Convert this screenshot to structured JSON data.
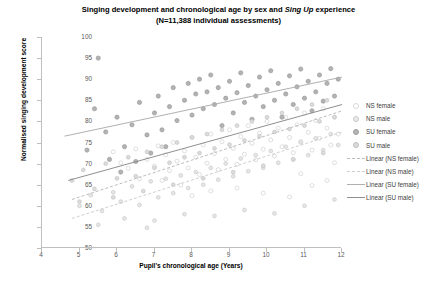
{
  "title": {
    "line1_a": "Singing development and chronological age by sex and ",
    "line1_italic": "Sing Up",
    "line1_b": " experience",
    "line2": "(N=11,388 individual assessments)"
  },
  "axes": {
    "xlabel": "Pupil's chronological age (Years)",
    "ylabel": "Normalised singing development score",
    "xticks": [
      "4",
      "5",
      "6",
      "7",
      "8",
      "9",
      "10",
      "11",
      "12"
    ],
    "yticks": [
      "100",
      "95",
      "90",
      "85",
      "80",
      "75",
      "70",
      "65",
      "60",
      "55",
      "50"
    ]
  },
  "legend": {
    "items": [
      {
        "label": "NS female",
        "key": "marker",
        "style": "nsf"
      },
      {
        "label": "NS male",
        "key": "marker",
        "style": "nsm"
      },
      {
        "label": "SU female",
        "key": "marker",
        "style": "suf"
      },
      {
        "label": "SU male",
        "key": "marker",
        "style": "sum"
      },
      {
        "label": "Linear (NS female)",
        "key": "line",
        "style": "nsf"
      },
      {
        "label": "Linear (NS male)",
        "key": "line",
        "style": "nsm"
      },
      {
        "label": "Linear (SU female)",
        "key": "line",
        "style": "suf"
      },
      {
        "label": "Linear (SU male)",
        "key": "line",
        "style": "sum"
      }
    ]
  },
  "colors": {
    "ns_female": "#d9d9d9",
    "ns_male": "#c9c9c9",
    "su_female": "#a6a6a6",
    "su_male": "#d0d0d0",
    "axis": "#bfbfbf",
    "tick_text": "#595959"
  },
  "chart_data": {
    "type": "scatter",
    "title": "Singing development and chronological age by sex and Sing Up experience (N=11,388 individual assessments)",
    "xlabel": "Pupil's chronological age (Years)",
    "ylabel": "Normalised singing development score",
    "xlim": [
      4,
      12
    ],
    "ylim": [
      50,
      100
    ],
    "xticks": [
      4,
      5,
      6,
      7,
      8,
      9,
      10,
      11,
      12
    ],
    "yticks": [
      50,
      55,
      60,
      65,
      70,
      75,
      80,
      85,
      90,
      95,
      100
    ],
    "grid": false,
    "legend_position": "right",
    "series": [
      {
        "name": "NS female",
        "marker": "open-circle",
        "color": "#d9d9d9",
        "points": [
          [
            5.9,
            72.8
          ],
          [
            6.1,
            70.2
          ],
          [
            6.3,
            68.9
          ],
          [
            6.5,
            73.5
          ],
          [
            6.6,
            66.4
          ],
          [
            6.8,
            71.0
          ],
          [
            7.0,
            69.4
          ],
          [
            7.1,
            74.2
          ],
          [
            7.2,
            66.0
          ],
          [
            7.3,
            72.1
          ],
          [
            7.4,
            68.3
          ],
          [
            7.5,
            75.0
          ],
          [
            7.6,
            70.6
          ],
          [
            7.7,
            64.9
          ],
          [
            7.8,
            73.0
          ],
          [
            7.9,
            69.0
          ],
          [
            8.0,
            76.2
          ],
          [
            8.1,
            71.5
          ],
          [
            8.2,
            67.4
          ],
          [
            8.3,
            74.4
          ],
          [
            8.4,
            70.1
          ],
          [
            8.5,
            77.0
          ],
          [
            8.6,
            72.4
          ],
          [
            8.7,
            68.6
          ],
          [
            8.8,
            75.2
          ],
          [
            8.9,
            71.0
          ],
          [
            9.0,
            78.0
          ],
          [
            9.1,
            73.6
          ],
          [
            9.2,
            69.8
          ],
          [
            9.3,
            76.4
          ],
          [
            9.4,
            72.2
          ],
          [
            9.5,
            79.0
          ],
          [
            9.6,
            74.8
          ],
          [
            9.7,
            70.9
          ],
          [
            9.8,
            77.2
          ],
          [
            9.9,
            73.4
          ],
          [
            10.0,
            80.0
          ],
          [
            10.1,
            75.6
          ],
          [
            10.2,
            71.8
          ],
          [
            10.3,
            78.4
          ],
          [
            10.4,
            74.0
          ],
          [
            10.5,
            81.0
          ],
          [
            10.6,
            76.2
          ],
          [
            10.7,
            72.6
          ],
          [
            10.8,
            79.2
          ],
          [
            10.9,
            75.0
          ],
          [
            11.0,
            82.0
          ],
          [
            11.1,
            77.4
          ],
          [
            11.2,
            73.2
          ],
          [
            11.3,
            80.2
          ],
          [
            11.4,
            76.0
          ],
          [
            11.5,
            83.0
          ],
          [
            11.6,
            78.4
          ],
          [
            11.7,
            74.4
          ],
          [
            11.8,
            81.0
          ],
          [
            11.9,
            77.0
          ],
          [
            9.2,
            64.2
          ],
          [
            9.9,
            63.0
          ],
          [
            10.6,
            62.1
          ],
          [
            11.2,
            64.8
          ],
          [
            8.5,
            63.5
          ],
          [
            10.9,
            67.6
          ],
          [
            11.6,
            66.0
          ],
          [
            8.0,
            62.4
          ],
          [
            11.8,
            70.2
          ]
        ]
      },
      {
        "name": "NS male",
        "marker": "light-filled-circle",
        "color": "#c9c9c9",
        "points": [
          [
            5.0,
            60.0
          ],
          [
            5.3,
            62.5
          ],
          [
            5.6,
            58.8
          ],
          [
            5.9,
            63.2
          ],
          [
            6.1,
            61.0
          ],
          [
            6.4,
            64.6
          ],
          [
            6.6,
            60.2
          ],
          [
            6.9,
            65.8
          ],
          [
            7.1,
            62.0
          ],
          [
            7.3,
            66.4
          ],
          [
            7.5,
            63.0
          ],
          [
            7.7,
            67.2
          ],
          [
            7.9,
            64.2
          ],
          [
            8.1,
            68.0
          ],
          [
            8.3,
            65.0
          ],
          [
            8.5,
            69.0
          ],
          [
            8.7,
            66.2
          ],
          [
            8.9,
            70.0
          ],
          [
            9.1,
            67.0
          ],
          [
            9.3,
            71.2
          ],
          [
            9.5,
            68.2
          ],
          [
            9.7,
            72.0
          ],
          [
            9.9,
            69.0
          ],
          [
            10.1,
            73.0
          ],
          [
            10.3,
            70.2
          ],
          [
            10.5,
            74.0
          ],
          [
            10.7,
            71.0
          ],
          [
            10.9,
            75.2
          ],
          [
            11.1,
            72.0
          ],
          [
            11.3,
            76.0
          ],
          [
            11.5,
            73.2
          ],
          [
            11.7,
            77.0
          ],
          [
            11.9,
            74.4
          ],
          [
            6.2,
            57.0
          ],
          [
            7.0,
            56.5
          ],
          [
            7.8,
            58.0
          ],
          [
            8.6,
            57.6
          ],
          [
            9.4,
            59.0
          ],
          [
            10.2,
            58.2
          ],
          [
            11.0,
            60.0
          ],
          [
            11.8,
            61.5
          ],
          [
            5.5,
            55.5
          ],
          [
            6.8,
            54.8
          ]
        ]
      },
      {
        "name": "SU female",
        "marker": "dark-filled-circle",
        "color": "#a6a6a6",
        "points": [
          [
            5.5,
            95.0
          ],
          [
            5.4,
            83.0
          ],
          [
            5.7,
            77.5
          ],
          [
            6.0,
            81.0
          ],
          [
            6.2,
            74.0
          ],
          [
            6.4,
            79.2
          ],
          [
            6.6,
            84.5
          ],
          [
            6.8,
            76.8
          ],
          [
            7.0,
            82.0
          ],
          [
            7.1,
            86.0
          ],
          [
            7.2,
            78.0
          ],
          [
            7.4,
            83.5
          ],
          [
            7.5,
            88.0
          ],
          [
            7.6,
            80.2
          ],
          [
            7.8,
            85.0
          ],
          [
            7.9,
            89.0
          ],
          [
            8.0,
            81.5
          ],
          [
            8.1,
            86.5
          ],
          [
            8.2,
            90.0
          ],
          [
            8.3,
            83.0
          ],
          [
            8.4,
            87.0
          ],
          [
            8.5,
            91.0
          ],
          [
            8.6,
            84.0
          ],
          [
            8.7,
            88.0
          ],
          [
            8.8,
            79.0
          ],
          [
            8.9,
            85.5
          ],
          [
            9.0,
            89.5
          ],
          [
            9.1,
            82.0
          ],
          [
            9.2,
            86.8
          ],
          [
            9.3,
            91.5
          ],
          [
            9.4,
            84.5
          ],
          [
            9.5,
            88.5
          ],
          [
            9.6,
            80.5
          ],
          [
            9.7,
            86.0
          ],
          [
            9.8,
            90.5
          ],
          [
            9.9,
            83.5
          ],
          [
            10.0,
            87.5
          ],
          [
            10.1,
            92.0
          ],
          [
            10.2,
            85.0
          ],
          [
            10.3,
            89.0
          ],
          [
            10.4,
            81.0
          ],
          [
            10.5,
            86.5
          ],
          [
            10.6,
            90.8
          ],
          [
            10.7,
            84.0
          ],
          [
            10.8,
            88.2
          ],
          [
            10.9,
            92.4
          ],
          [
            11.0,
            85.5
          ],
          [
            11.1,
            89.5
          ],
          [
            11.2,
            82.5
          ],
          [
            11.3,
            87.0
          ],
          [
            11.4,
            91.0
          ],
          [
            11.5,
            84.8
          ],
          [
            11.6,
            89.0
          ],
          [
            11.7,
            92.5
          ],
          [
            11.8,
            86.0
          ],
          [
            11.9,
            90.0
          ],
          [
            5.2,
            73.2
          ],
          [
            5.8,
            71.0
          ],
          [
            6.1,
            68.0
          ],
          [
            6.5,
            70.5
          ],
          [
            6.9,
            72.5
          ],
          [
            7.3,
            74.0
          ]
        ]
      },
      {
        "name": "SU male",
        "marker": "mid-filled-circle",
        "color": "#d0d0d0",
        "points": [
          [
            4.8,
            66.0
          ],
          [
            5.1,
            68.5
          ],
          [
            5.4,
            64.0
          ],
          [
            5.7,
            70.0
          ],
          [
            6.0,
            66.5
          ],
          [
            6.3,
            71.5
          ],
          [
            6.5,
            67.0
          ],
          [
            6.8,
            72.8
          ],
          [
            7.0,
            69.0
          ],
          [
            7.2,
            74.0
          ],
          [
            7.4,
            70.2
          ],
          [
            7.6,
            75.0
          ],
          [
            7.8,
            71.5
          ],
          [
            8.0,
            76.2
          ],
          [
            8.2,
            72.5
          ],
          [
            8.4,
            77.0
          ],
          [
            8.6,
            73.6
          ],
          [
            8.8,
            78.0
          ],
          [
            9.0,
            74.5
          ],
          [
            9.2,
            79.0
          ],
          [
            9.4,
            75.5
          ],
          [
            9.6,
            80.0
          ],
          [
            9.8,
            76.5
          ],
          [
            10.0,
            81.0
          ],
          [
            10.2,
            77.5
          ],
          [
            10.4,
            82.0
          ],
          [
            10.6,
            78.2
          ],
          [
            10.8,
            83.0
          ],
          [
            11.0,
            79.0
          ],
          [
            11.2,
            84.0
          ],
          [
            11.4,
            80.0
          ],
          [
            11.6,
            85.0
          ],
          [
            11.8,
            81.0
          ],
          [
            5.0,
            61.0
          ],
          [
            5.9,
            62.0
          ],
          [
            6.7,
            63.5
          ],
          [
            7.5,
            65.0
          ],
          [
            8.3,
            66.5
          ],
          [
            9.1,
            68.0
          ],
          [
            9.9,
            69.5
          ],
          [
            10.7,
            71.0
          ],
          [
            11.5,
            72.5
          ]
        ]
      }
    ],
    "trendlines": [
      {
        "name": "Linear (NS female)",
        "style": "dashed",
        "color": "#bdbdbd",
        "x": [
          4.8,
          12.0
        ],
        "y": [
          61.5,
          82.5
        ]
      },
      {
        "name": "Linear (NS male)",
        "style": "dashed",
        "color": "#cfcfcf",
        "x": [
          4.8,
          12.0
        ],
        "y": [
          57.0,
          77.5
        ]
      },
      {
        "name": "Linear (SU female)",
        "style": "solid",
        "color": "#b0b0b0",
        "x": [
          4.6,
          12.0
        ],
        "y": [
          76.5,
          90.5
        ]
      },
      {
        "name": "Linear (SU male)",
        "style": "solid",
        "color": "#8f8f8f",
        "x": [
          4.7,
          12.0
        ],
        "y": [
          66.0,
          84.0
        ]
      }
    ]
  }
}
